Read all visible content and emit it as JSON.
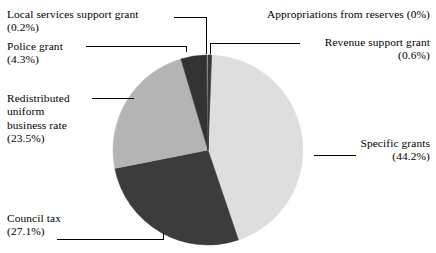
{
  "chart_data": {
    "type": "pie",
    "title": "",
    "subtitle": "",
    "xlabel": "",
    "ylabel": "",
    "legend_position": "callout-labels",
    "grid": false,
    "start_angle_deg": 0,
    "direction": "clockwise",
    "center": {
      "x": 208,
      "y": 150
    },
    "radius": 95,
    "categories": [
      "Revenue support grant",
      "Specific grants",
      "Council tax",
      "Redistributed uniform business rate",
      "Police grant",
      "Local services support grant",
      "Appropriations from reserves"
    ],
    "values": [
      0.6,
      44.2,
      27.1,
      23.5,
      4.3,
      0.2,
      0.0
    ],
    "value_unit": "%",
    "colors": [
      "#3a3a3a",
      "#dedede",
      "#3c3c3c",
      "#b4b4b4",
      "#333333",
      "#3a3a3a",
      "#ffffff"
    ],
    "slices": [
      {
        "name": "Revenue support grant",
        "value": 0.6,
        "percent_label": "(0.6%)",
        "color": "#3a3a3a",
        "start_deg": 0.0,
        "end_deg": 2.16
      },
      {
        "name": "Specific grants",
        "value": 44.2,
        "percent_label": "(44.2%)",
        "color": "#dedede",
        "start_deg": 2.16,
        "end_deg": 161.28
      },
      {
        "name": "Council tax",
        "value": 27.1,
        "percent_label": "(27.1%)",
        "color": "#3c3c3c",
        "start_deg": 161.28,
        "end_deg": 258.84
      },
      {
        "name": "Redistributed uniform business rate",
        "value": 23.5,
        "percent_label": "(23.5%)",
        "color": "#b4b4b4",
        "start_deg": 258.84,
        "end_deg": 343.44
      },
      {
        "name": "Police grant",
        "value": 4.3,
        "percent_label": "(4.3%)",
        "color": "#333333",
        "start_deg": 343.44,
        "end_deg": 358.92
      },
      {
        "name": "Local services support grant",
        "value": 0.2,
        "percent_label": "(0.2%)",
        "color": "#3a3a3a",
        "start_deg": 358.92,
        "end_deg": 359.64
      },
      {
        "name": "Appropriations from reserves",
        "value": 0.0,
        "percent_label": "(0%)",
        "color": "#ffffff",
        "start_deg": 359.64,
        "end_deg": 360.0
      }
    ]
  },
  "labels": {
    "local_services": {
      "line1": "Local services support grant",
      "line2": "(0.2%)"
    },
    "police": {
      "line1": "Police grant",
      "line2": "(4.3%)"
    },
    "redistributed": {
      "line1": "Redistributed",
      "line2": "uniform",
      "line3": "business rate",
      "line4": "(23.5%)"
    },
    "council_tax": {
      "line1": "Council tax",
      "line2": "(27.1%)"
    },
    "appropriations": {
      "line1": "Appropriations from reserves (0%)"
    },
    "revenue_support": {
      "line1": "Revenue support grant",
      "line2": "(0.6%)"
    },
    "specific_grants": {
      "line1": "Specific grants",
      "line2": "(44.2%)"
    }
  },
  "style": {
    "background": "#ffffff",
    "text_color": "#000000",
    "leader_line_color": "#000000"
  }
}
